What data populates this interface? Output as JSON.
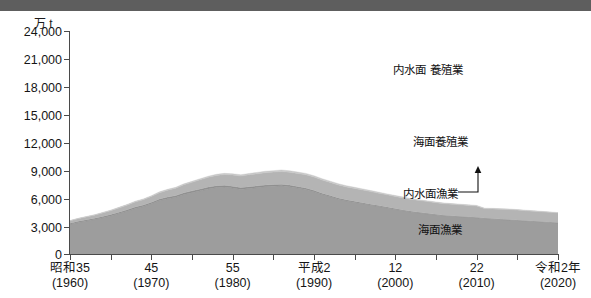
{
  "chart_data": {
    "type": "area",
    "stacked": true,
    "title": "",
    "unit_label": "万 t",
    "ylabel": "万 t",
    "xlabel": "",
    "ylim": [
      0,
      24000
    ],
    "yticks": [
      0,
      3000,
      6000,
      9000,
      12000,
      15000,
      18000,
      21000,
      24000
    ],
    "ytick_labels": [
      "0",
      "3,000",
      "6,000",
      "9,000",
      "12,000",
      "15,000",
      "18,000",
      "21,000",
      "24,000"
    ],
    "xlim": [
      1960,
      2020
    ],
    "xticks": [
      1960,
      1965,
      1970,
      1975,
      1980,
      1985,
      1990,
      1995,
      2000,
      2005,
      2010,
      2015,
      2020
    ],
    "xtick_labels": [
      {
        "era": "昭和35",
        "year": "(1960)",
        "value": 1960
      },
      {
        "era": "45",
        "year": "(1970)",
        "value": 1970
      },
      {
        "era": "55",
        "year": "(1980)",
        "value": 1980
      },
      {
        "era": "平成2",
        "year": "(1990)",
        "value": 1990
      },
      {
        "era": "12",
        "year": "(2000)",
        "value": 2000
      },
      {
        "era": "22",
        "year": "(2010)",
        "value": 2010
      },
      {
        "era": "令和2年",
        "year": "(2020)",
        "value": 2020
      }
    ],
    "grid": false,
    "legend_position": "inline-annotations",
    "x": [
      1960,
      1961,
      1962,
      1963,
      1964,
      1965,
      1966,
      1967,
      1968,
      1969,
      1970,
      1971,
      1972,
      1973,
      1974,
      1975,
      1976,
      1977,
      1978,
      1979,
      1980,
      1981,
      1982,
      1983,
      1984,
      1985,
      1986,
      1987,
      1988,
      1989,
      1990,
      1991,
      1992,
      1993,
      1994,
      1995,
      1996,
      1997,
      1998,
      1999,
      2000,
      2001,
      2002,
      2003,
      2004,
      2005,
      2006,
      2007,
      2008,
      2009,
      2010,
      2011,
      2012,
      2013,
      2014,
      2015,
      2016,
      2017,
      2018,
      2019,
      2020
    ],
    "series": [
      {
        "name": "海面漁業",
        "color": "#9d9d9d",
        "order": 1,
        "values": [
          3200,
          3400,
          3550,
          3700,
          3900,
          4100,
          4350,
          4600,
          4900,
          5100,
          5400,
          5750,
          5950,
          6100,
          6400,
          6600,
          6800,
          7000,
          7150,
          7200,
          7100,
          6950,
          7050,
          7150,
          7250,
          7300,
          7350,
          7250,
          7100,
          6950,
          6700,
          6400,
          6150,
          5900,
          5700,
          5550,
          5400,
          5250,
          5100,
          4950,
          4800,
          4650,
          4500,
          4400,
          4300,
          4200,
          4100,
          4050,
          4000,
          3950,
          3900,
          3800,
          3750,
          3700,
          3650,
          3600,
          3550,
          3500,
          3450,
          3400,
          3350
        ]
      },
      {
        "name": "内水面漁業",
        "color": "#8f8f8f",
        "order": 2,
        "values": [
          120,
          125,
          130,
          135,
          140,
          145,
          150,
          155,
          160,
          165,
          170,
          175,
          180,
          185,
          190,
          195,
          200,
          205,
          205,
          205,
          200,
          195,
          190,
          185,
          180,
          175,
          170,
          165,
          160,
          155,
          150,
          145,
          140,
          135,
          130,
          125,
          120,
          115,
          110,
          105,
          100,
          95,
          90,
          85,
          80,
          78,
          76,
          74,
          72,
          70,
          68,
          66,
          64,
          62,
          60,
          58,
          56,
          54,
          52,
          50,
          48
        ]
      },
      {
        "name": "海面養殖業",
        "color": "#b4b4b4",
        "order": 3,
        "values": [
          250,
          280,
          310,
          340,
          380,
          420,
          460,
          500,
          540,
          580,
          620,
          680,
          740,
          800,
          860,
          920,
          990,
          1050,
          1100,
          1150,
          1200,
          1250,
          1280,
          1300,
          1320,
          1340,
          1360,
          1380,
          1400,
          1420,
          1430,
          1420,
          1410,
          1400,
          1390,
          1380,
          1370,
          1350,
          1330,
          1310,
          1300,
          1290,
          1280,
          1270,
          1260,
          1250,
          1240,
          1230,
          1220,
          1210,
          1200,
          1000,
          1040,
          1060,
          1080,
          1070,
          1060,
          1050,
          1040,
          1030,
          1020
        ]
      },
      {
        "name": "内水面養殖業",
        "color": "#c8c8c8",
        "order": 4,
        "values": [
          30,
          35,
          40,
          45,
          50,
          55,
          60,
          65,
          70,
          75,
          80,
          85,
          90,
          95,
          100,
          105,
          110,
          115,
          120,
          125,
          130,
          135,
          140,
          145,
          150,
          155,
          160,
          160,
          155,
          150,
          145,
          140,
          135,
          130,
          125,
          120,
          115,
          110,
          105,
          100,
          95,
          90,
          85,
          80,
          75,
          72,
          70,
          68,
          66,
          64,
          62,
          60,
          58,
          56,
          54,
          52,
          50,
          48,
          46,
          44,
          42
        ]
      }
    ],
    "total_start": 3600,
    "total_peak": 21000,
    "annotations": [
      {
        "name": "内水面養殖業",
        "text_lines": [
          "内水面",
          "養殖業"
        ]
      },
      {
        "name": "海面養殖業",
        "text_lines": [
          "海面養殖業"
        ]
      },
      {
        "name": "内水面漁業",
        "text_lines": [
          "内水面漁業"
        ],
        "leader": "elbow-up-arrow"
      },
      {
        "name": "海面漁業",
        "text_lines": [
          "海面漁業"
        ]
      }
    ]
  },
  "colors": {
    "header_bar": "#5e5e5e",
    "axis": "#4a4a4a",
    "text": "#151515",
    "background": "#ffffff"
  }
}
